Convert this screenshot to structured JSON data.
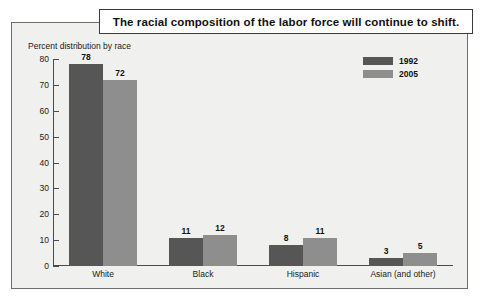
{
  "title": "The racial composition of the labor force will continue to shift.",
  "subtitle": "Percent distribution by race",
  "legend": {
    "items": [
      {
        "label": "1992",
        "color": "#565656"
      },
      {
        "label": "2005",
        "color": "#8e8e8e"
      }
    ]
  },
  "chart_data": {
    "type": "bar",
    "title": "The racial composition of the labor force will continue to shift.",
    "subtitle": "Percent distribution by race",
    "xlabel": "",
    "ylabel": "Percent distribution by race",
    "categories": [
      "White",
      "Black",
      "Hispanic",
      "Asian (and other)"
    ],
    "series": [
      {
        "name": "1992",
        "color": "#565656",
        "values": [
          78,
          11,
          8,
          3
        ]
      },
      {
        "name": "2005",
        "color": "#8e8e8e",
        "values": [
          72,
          12,
          11,
          5
        ]
      }
    ],
    "ylim": [
      0,
      80
    ],
    "yticks": [
      0,
      10,
      20,
      30,
      40,
      50,
      60,
      70,
      80
    ],
    "ytick_labels": [
      "0",
      "10",
      "20",
      "30",
      "40",
      "50",
      "60",
      "70",
      "80"
    ],
    "grid": false,
    "legend_position": "top-right",
    "value_labels": true
  }
}
